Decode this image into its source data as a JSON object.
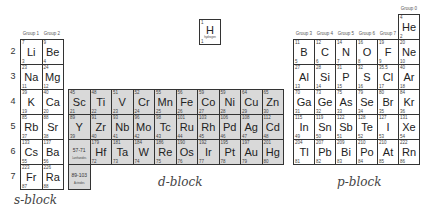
{
  "block_labels": {
    "s": "s-block",
    "d": "d-block",
    "p": "p-block"
  },
  "periods": [
    "2",
    "3",
    "4",
    "5",
    "6",
    "7"
  ],
  "group_labels": {
    "g1": "Group 1",
    "g2": "Group 2",
    "g3": "Group 3",
    "g4": "Group 4",
    "g5": "Group 5",
    "g6": "Group 6",
    "g7": "Group 7",
    "g0": "Group 0"
  },
  "hydrogen": {
    "mass": "1",
    "symbol": "H",
    "name": "hydrogen",
    "number": "1"
  },
  "helium": {
    "mass": "4",
    "symbol": "He",
    "number": "2"
  },
  "s_block": [
    [
      {
        "m": "7",
        "s": "Li",
        "n": "3"
      },
      {
        "m": "9",
        "s": "Be",
        "n": "4"
      }
    ],
    [
      {
        "m": "23",
        "s": "Na",
        "n": "11"
      },
      {
        "m": "24",
        "s": "Mg",
        "n": "12"
      }
    ],
    [
      {
        "m": "39",
        "s": "K",
        "n": "19"
      },
      {
        "m": "40",
        "s": "Ca",
        "n": "20"
      }
    ],
    [
      {
        "m": "85",
        "s": "Rb",
        "n": "37"
      },
      {
        "m": "88",
        "s": "Sr",
        "n": "38"
      }
    ],
    [
      {
        "m": "133",
        "s": "Cs",
        "n": "55"
      },
      {
        "m": "137",
        "s": "Ba",
        "n": "56"
      }
    ],
    [
      {
        "m": "223",
        "s": "Fr",
        "n": "87"
      },
      {
        "m": "226",
        "s": "Ra",
        "n": "88"
      }
    ]
  ],
  "d_block": [
    [
      {
        "m": "45",
        "s": "Sc",
        "n": "21"
      },
      {
        "m": "48",
        "s": "Ti",
        "n": "22"
      },
      {
        "m": "51",
        "s": "V",
        "n": "23"
      },
      {
        "m": "52",
        "s": "Cr",
        "n": "24"
      },
      {
        "m": "55",
        "s": "Mn",
        "n": "25"
      },
      {
        "m": "56",
        "s": "Fe",
        "n": "26"
      },
      {
        "m": "59",
        "s": "Co",
        "n": "27"
      },
      {
        "m": "59",
        "s": "Ni",
        "n": "28"
      },
      {
        "m": "64",
        "s": "Cu",
        "n": "29"
      },
      {
        "m": "65",
        "s": "Zn",
        "n": "30"
      }
    ],
    [
      {
        "m": "89",
        "s": "Y",
        "n": "39"
      },
      {
        "m": "91",
        "s": "Zr",
        "n": "40"
      },
      {
        "m": "93",
        "s": "Nb",
        "n": "41"
      },
      {
        "m": "96",
        "s": "Mo",
        "n": "42"
      },
      {
        "m": "98",
        "s": "Tc",
        "n": "43"
      },
      {
        "m": "101",
        "s": "Ru",
        "n": "44"
      },
      {
        "m": "103",
        "s": "Rh",
        "n": "45"
      },
      {
        "m": "106",
        "s": "Pd",
        "n": "46"
      },
      {
        "m": "108",
        "s": "Ag",
        "n": "47"
      },
      {
        "m": "112",
        "s": "Cd",
        "n": "48"
      }
    ],
    [
      {
        "range": "57-71",
        "sub": "Lanthanides"
      },
      {
        "m": "179",
        "s": "Hf",
        "n": "72"
      },
      {
        "m": "181",
        "s": "Ta",
        "n": "73"
      },
      {
        "m": "184",
        "s": "W",
        "n": "74"
      },
      {
        "m": "186",
        "s": "Re",
        "n": "75"
      },
      {
        "m": "190",
        "s": "Os",
        "n": "76"
      },
      {
        "m": "192",
        "s": "Ir",
        "n": "77"
      },
      {
        "m": "195",
        "s": "Pt",
        "n": "78"
      },
      {
        "m": "197",
        "s": "Au",
        "n": "79"
      },
      {
        "m": "201",
        "s": "Hg",
        "n": "80"
      }
    ],
    [
      {
        "range": "89-103",
        "sub": "Actinides"
      }
    ]
  ],
  "p_block": [
    [
      {
        "m": "11",
        "s": "B",
        "n": "5"
      },
      {
        "m": "12",
        "s": "C",
        "n": "6"
      },
      {
        "m": "14",
        "s": "N",
        "n": "7"
      },
      {
        "m": "16",
        "s": "O",
        "n": "8"
      },
      {
        "m": "19",
        "s": "F",
        "n": "9"
      },
      {
        "m": "20",
        "s": "Ne",
        "n": "10"
      }
    ],
    [
      {
        "m": "27",
        "s": "Al",
        "n": "13"
      },
      {
        "m": "28",
        "s": "Si",
        "n": "14"
      },
      {
        "m": "31",
        "s": "P",
        "n": "15"
      },
      {
        "m": "32",
        "s": "S",
        "n": "16"
      },
      {
        "m": "35.5",
        "s": "Cl",
        "n": "17"
      },
      {
        "m": "40",
        "s": "Ar",
        "n": "18"
      }
    ],
    [
      {
        "m": "70",
        "s": "Ga",
        "n": "31"
      },
      {
        "m": "73",
        "s": "Ge",
        "n": "32"
      },
      {
        "m": "75",
        "s": "As",
        "n": "33"
      },
      {
        "m": "79",
        "s": "Se",
        "n": "34"
      },
      {
        "m": "80",
        "s": "Br",
        "n": "35"
      },
      {
        "m": "84",
        "s": "Kr",
        "n": "36"
      }
    ],
    [
      {
        "m": "115",
        "s": "In",
        "n": "49"
      },
      {
        "m": "119",
        "s": "Sn",
        "n": "50"
      },
      {
        "m": "122",
        "s": "Sb",
        "n": "51"
      },
      {
        "m": "128",
        "s": "Te",
        "n": "52"
      },
      {
        "m": "127",
        "s": "I",
        "n": "53"
      },
      {
        "m": "131",
        "s": "Xe",
        "n": "54"
      }
    ],
    [
      {
        "m": "204",
        "s": "Tl",
        "n": "81"
      },
      {
        "m": "207",
        "s": "Pb",
        "n": "82"
      },
      {
        "m": "209",
        "s": "Bi",
        "n": "83"
      },
      {
        "m": "210",
        "s": "Po",
        "n": "84"
      },
      {
        "m": "210",
        "s": "At",
        "n": "85"
      },
      {
        "m": "222",
        "s": "Rn",
        "n": "86"
      }
    ]
  ]
}
